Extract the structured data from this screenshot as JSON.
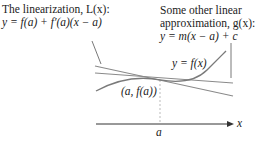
{
  "diagram": {
    "linearization_label": {
      "line1": "The linearization, L(x):",
      "line2": "y = f(a) + f′(a)(x − a)"
    },
    "other_approx_label": {
      "line1": "Some other linear",
      "line2": "approximation, g(x):",
      "line3": "y = m(x − a) + c"
    },
    "curve_label": "y = f(x)",
    "point_label": "(a, f(a))",
    "x_tick_label": "a",
    "x_axis_label": "x",
    "colors": {
      "curve": "#7a7a7a",
      "lines": "#8a8a8a",
      "axis": "#333333",
      "text": "#222222"
    }
  }
}
